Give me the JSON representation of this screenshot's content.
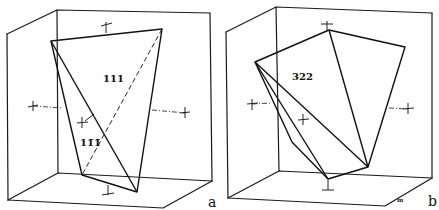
{
  "figure": {
    "panels": [
      {
        "id": "a",
        "panel_label": "a",
        "face_labels": [
          "111",
          "11̄1̄"
        ]
      },
      {
        "id": "b",
        "panel_label": "b",
        "face_labels": [
          "322"
        ],
        "corner_mark": "m"
      }
    ]
  },
  "colors": {
    "line": "#1a1a1a",
    "background": "#ffffff"
  }
}
